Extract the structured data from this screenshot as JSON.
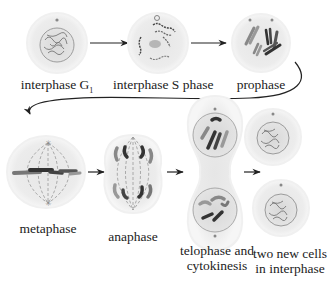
{
  "stages": [
    {
      "id": "interphase-g1",
      "label": "interphase G",
      "subscript": "1"
    },
    {
      "id": "interphase-s",
      "label": "interphase S phase"
    },
    {
      "id": "prophase",
      "label": "prophase"
    },
    {
      "id": "metaphase",
      "label": "metaphase"
    },
    {
      "id": "anaphase",
      "label": "anaphase"
    },
    {
      "id": "telophase",
      "label_line1": "telophase and",
      "label_line2": "cytokinesis"
    },
    {
      "id": "daughter-cells",
      "label_line1": "two new cells",
      "label_line2": "in interphase"
    }
  ],
  "colors": {
    "cell_fill": "#ececec",
    "cell_halo": "#f4f4f4",
    "nucleus_fill": "#dcdcdc",
    "nucleus_edge": "#8a8a8a",
    "chromatin": "#7a7a7a",
    "chromosome_dark": "#3a3a3a",
    "chromosome_mid": "#8c8c8c",
    "arrow": "#222222",
    "spindle": "#9a9a9a"
  }
}
